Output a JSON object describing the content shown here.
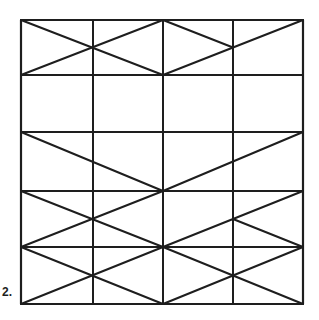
{
  "figure": {
    "label": "2.",
    "stroke_color": "#1e1e1e",
    "background": "#ffffff",
    "grid": {
      "columns": 4,
      "rows": 5
    },
    "diagonal_segments": [
      {
        "name": "row1-diag-a",
        "from": [
          0,
          0
        ],
        "to": [
          2,
          1
        ]
      },
      {
        "name": "row1-diag-b",
        "from": [
          0,
          1
        ],
        "to": [
          2,
          0
        ]
      },
      {
        "name": "row1-diag-c",
        "from": [
          2,
          0
        ],
        "to": [
          3,
          0.5
        ]
      },
      {
        "name": "row1-diag-d",
        "from": [
          2,
          1
        ],
        "to": [
          4,
          0
        ]
      },
      {
        "name": "row3-diag-a",
        "from": [
          0,
          2
        ],
        "to": [
          2,
          3
        ]
      },
      {
        "name": "row3-diag-b",
        "from": [
          2,
          3
        ],
        "to": [
          4,
          2
        ]
      },
      {
        "name": "row4-diag-a",
        "from": [
          0,
          3
        ],
        "to": [
          2,
          4
        ]
      },
      {
        "name": "row4-diag-b",
        "from": [
          0,
          4
        ],
        "to": [
          2,
          3
        ]
      },
      {
        "name": "row4-diag-c",
        "from": [
          2,
          4
        ],
        "to": [
          4,
          3
        ]
      },
      {
        "name": "row4-diag-d",
        "from": [
          3,
          3.5
        ],
        "to": [
          4,
          4
        ]
      },
      {
        "name": "row5-diag-a",
        "from": [
          0,
          4
        ],
        "to": [
          2,
          5
        ]
      },
      {
        "name": "row5-diag-b",
        "from": [
          0,
          5
        ],
        "to": [
          2,
          4
        ]
      },
      {
        "name": "row5-diag-c",
        "from": [
          2,
          4
        ],
        "to": [
          4,
          5
        ]
      },
      {
        "name": "row5-diag-d",
        "from": [
          2,
          5
        ],
        "to": [
          4,
          4
        ]
      }
    ]
  }
}
